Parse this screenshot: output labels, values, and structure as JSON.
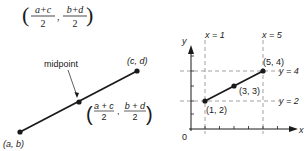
{
  "formula_top": {
    "num_left": "a+c",
    "den_left": "2",
    "num_right": "b+d",
    "den_right": "2",
    "separator": ","
  },
  "left_diagram": {
    "point_start_label": "(a, b)",
    "point_end_label": "(c, d)",
    "midpoint_label": "midpoint",
    "midpoint_formula": {
      "num_left": "a + c",
      "den_left": "2",
      "num_right": "b + d",
      "den_right": "2",
      "separator": ","
    }
  },
  "right_diagram": {
    "y_axis_label": "y",
    "x_axis_label": "x",
    "origin_label": "0",
    "vertical_line_labels": [
      "x = 1",
      "x = 5"
    ],
    "horizontal_line_labels": [
      "y = 4",
      "y = 2"
    ],
    "points": [
      {
        "label": "(1, 2)",
        "x": 1,
        "y": 2
      },
      {
        "label": "(3, 3)",
        "x": 3,
        "y": 3
      },
      {
        "label": "(5, 4)",
        "x": 5,
        "y": 4
      }
    ]
  },
  "colors": {
    "ink": "#1a1a1a",
    "dashed": "#7a7a7a",
    "background": "#ffffff"
  }
}
